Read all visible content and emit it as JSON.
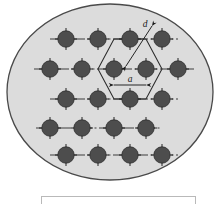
{
  "figure": {
    "kind": "crystal-lattice-diagram",
    "background_color": "#ffffff",
    "ellipse": {
      "name": "specimen-boundary-ellipse",
      "fill_color": "#dcdcdc",
      "stroke_color": "#4a4a4a",
      "center_x": 110,
      "center_y": 92,
      "radius_x": 103,
      "radius_y": 88
    },
    "atom": {
      "name": "atom-dot",
      "fill_color": "#4d4d4d",
      "stroke_color": "#2b2b2b",
      "radius": 8.2,
      "tick_color": "#1a1a1a"
    },
    "lattice_line_color": "#3d3d3d",
    "hexagon": {
      "name": "unit-cell-hexagon",
      "stroke_color": "#2b2b2b"
    },
    "rows": [
      {
        "y": 39,
        "xs": [
          66,
          98,
          130,
          162
        ],
        "axis_from": 50,
        "axis_to": 178
      },
      {
        "y": 69,
        "xs": [
          50,
          82,
          114,
          146,
          178
        ],
        "axis_from": 34,
        "axis_to": 194
      },
      {
        "y": 99,
        "xs": [
          66,
          98,
          130,
          162
        ],
        "axis_from": 50,
        "axis_to": 178
      },
      {
        "y": 128,
        "xs": [
          50,
          82,
          114,
          146
        ],
        "axis_from": 36,
        "axis_to": 162
      },
      {
        "y": 155,
        "xs": [
          66,
          98,
          130,
          162
        ],
        "axis_from": 50,
        "axis_to": 178
      }
    ],
    "labels": {
      "spacing_d": "d",
      "spacing_a": "a"
    },
    "dimension_d": {
      "name": "interplanar-spacing-dimension",
      "label": "d",
      "x1": 152,
      "y1": 26,
      "x2": 126,
      "y2": 66
    },
    "dimension_a": {
      "name": "lattice-constant-dimension",
      "label": "a",
      "x1": 114,
      "y1": 85,
      "x2": 146,
      "y2": 85
    },
    "caption_box": {
      "name": "caption-box",
      "x": 41,
      "y": 196,
      "width": 154,
      "height": 8,
      "border_color": "#b9b9b9",
      "fill_color": "#ffffff",
      "text": ""
    }
  }
}
